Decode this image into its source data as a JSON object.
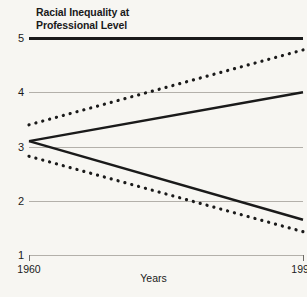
{
  "chart_data": {
    "type": "line",
    "title": "Racial Inequality at Professional Level",
    "title_lines": [
      "Racial Inequality at",
      "Professional Level"
    ],
    "xlabel": "Years",
    "ylabel": "",
    "x": [
      1960,
      1996
    ],
    "xtick_labels": [
      "1960",
      "1996"
    ],
    "xlim": [
      1960,
      1996
    ],
    "ylim": [
      1,
      5
    ],
    "ytick_labels": [
      "1",
      "2",
      "3",
      "4",
      "5"
    ],
    "yticks": [
      1,
      2,
      3,
      4,
      5
    ],
    "grid": true,
    "legend_position": "inline-right",
    "series": [
      {
        "name": "Brazil Females",
        "style": "dotted",
        "color": "#1a1a1a",
        "values": [
          3.4,
          4.78
        ]
      },
      {
        "name": "Brazil Males",
        "style": "solid",
        "color": "#1a1a1a",
        "values": [
          3.1,
          4.0
        ]
      },
      {
        "name": "U.S. Males",
        "style": "solid",
        "color": "#1a1a1a",
        "values": [
          3.1,
          1.65
        ]
      },
      {
        "name": "U.S. Females",
        "style": "dotted",
        "color": "#1a1a1a",
        "values": [
          2.82,
          1.43
        ]
      }
    ]
  },
  "colors": {
    "background": "#f7f6f2",
    "ink": "#1a1a1a",
    "gridline": "#b3b0aa"
  }
}
